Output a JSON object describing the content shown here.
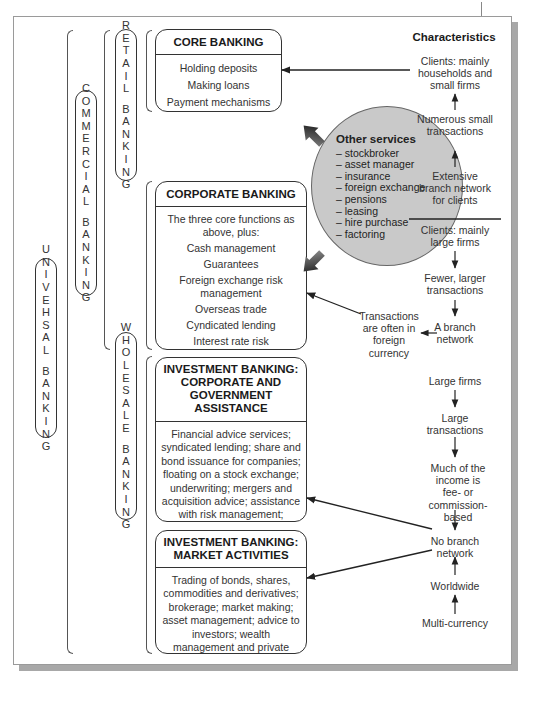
{
  "diagram": {
    "levels": {
      "universal": "UNIVEHSAL BANKING",
      "commercial": "COMMERCIAL BANKING",
      "retail": "RETAIL BANKING",
      "wholesale": "WHOLESALE BANKING"
    },
    "boxes": {
      "core_banking": {
        "title": "CORE BANKING",
        "items": [
          "Holding deposits",
          "Making loans",
          "Payment mechanisms"
        ]
      },
      "corporate_banking": {
        "title": "CORPORATE BANKING",
        "items": [
          "The three core functions as above, plus:",
          "Cash management",
          "Guarantees",
          "Foreign exchange risk management",
          "Overseas trade",
          "Cyndicated lending",
          "Interest rate risk management"
        ]
      },
      "investment_corporate": {
        "title": "INVESTMENT BANKING: CORPORATE AND GOVERNMENT ASSISTANCE",
        "body": "Financial advice services; syndicated lending; share and bond issuance for companies; floating on a stock exchange; underwriting; mergers and acquisition advice; assistance with risk management; privatisation of government-owned companies"
      },
      "investment_market": {
        "title": "INVESTMENT BANKING: MARKET ACTIVITIES",
        "body": "Trading of bonds, shares, commodities and derivatives; brokerage; market making; asset management; advice to investors; wealth management and private banking; prime brokerage for hedge funds; private equity investment"
      }
    },
    "other_services": {
      "title": "Other services",
      "items": [
        "– stockbroker",
        "– asset manager",
        "– insurance",
        "– foreign exchange",
        "– pensions",
        "– leasing",
        "– hire purchase",
        "– factoring"
      ]
    },
    "characteristics": {
      "title": "Characteristics",
      "retail": [
        "Clients: mainly households and small firms",
        "Numerous small transactions",
        "Extensive branch network for clients"
      ],
      "corporate": [
        "Clients: mainly large firms",
        "Fewer, larger transactions",
        "A branch network"
      ],
      "corporate_side": "Transactions are often in foreign currency",
      "investment": [
        "Large firms",
        "Large transactions",
        "Much of the income is fee- or commission-based",
        "No branch network",
        "Worldwide",
        "Multi-currency"
      ]
    },
    "colors": {
      "oval_fill": "#c9c9c9",
      "border": "#333333",
      "shadow": "#a8a8a8"
    }
  }
}
